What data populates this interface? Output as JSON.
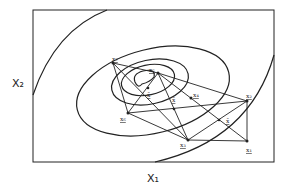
{
  "diagram": {
    "type": "contour-plot-with-simplex",
    "axes": {
      "x_label": "X₁",
      "y_label": "X₂"
    },
    "points": [
      {
        "id": "x1",
        "label": "x₁",
        "x": 247,
        "y": 141
      },
      {
        "id": "x2",
        "label": "x₂",
        "x": 247,
        "y": 101
      },
      {
        "id": "x3",
        "label": "x₃",
        "x": 188,
        "y": 140
      },
      {
        "id": "x4",
        "label": "x₄",
        "x": 191,
        "y": 98
      },
      {
        "id": "x5",
        "label": "x₅",
        "x": 158,
        "y": 73
      },
      {
        "id": "x6",
        "label": "x₆",
        "x": 128,
        "y": 113
      },
      {
        "id": "x7",
        "label": "x₇",
        "x": 113,
        "y": 63
      }
    ],
    "centroids": [
      {
        "id": "xbar-1",
        "label": "x̄",
        "x": 219,
        "y": 120
      },
      {
        "id": "xbar-2",
        "label": "x̄",
        "x": 174,
        "y": 109
      },
      {
        "id": "xbar-3",
        "label": "x̄",
        "x": 148,
        "y": 88
      }
    ]
  }
}
